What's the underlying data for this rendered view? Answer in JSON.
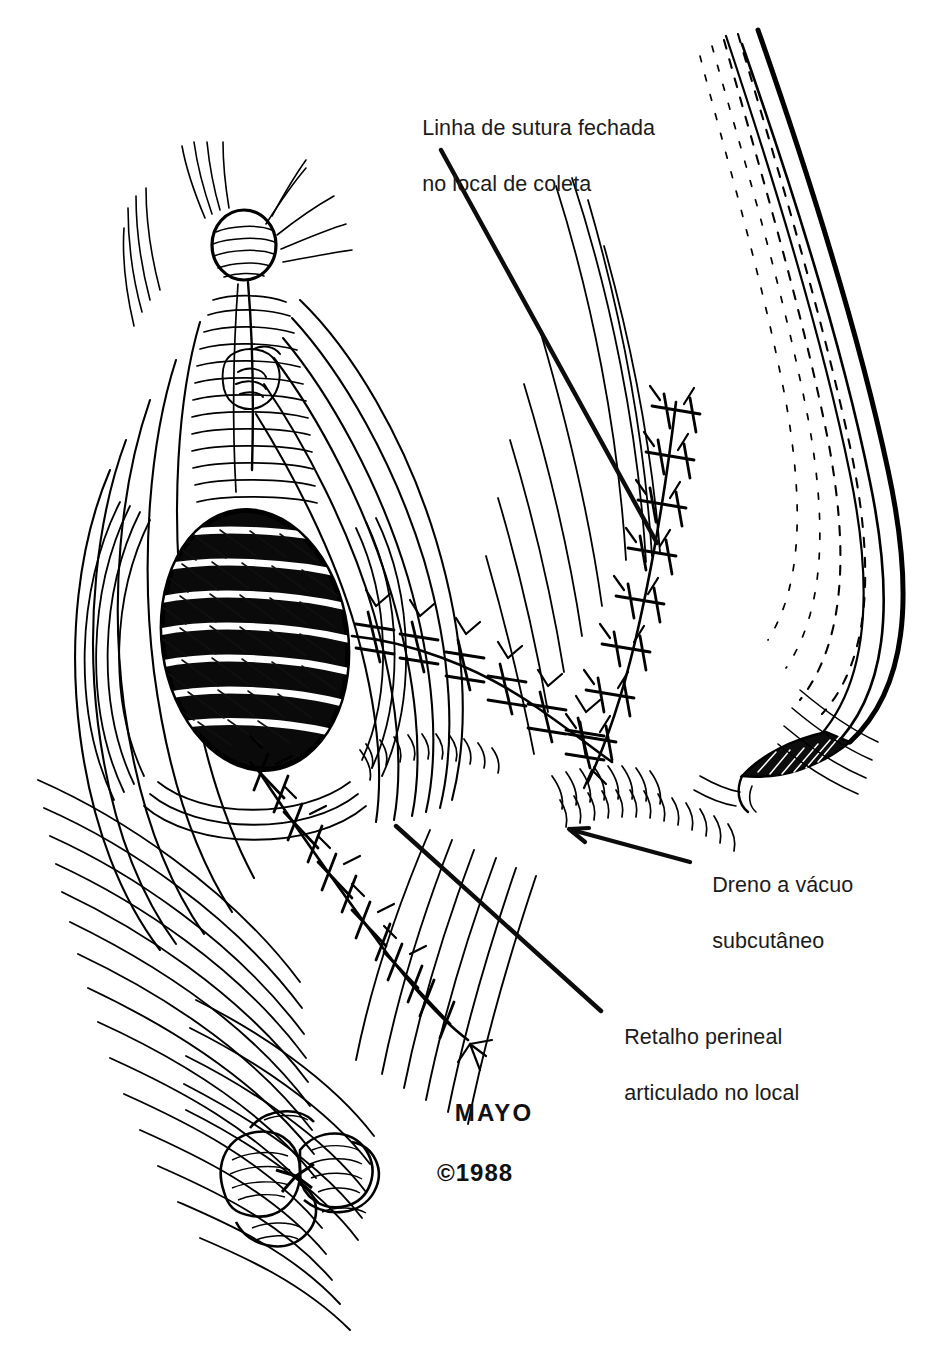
{
  "figure": {
    "kind": "medical-line-illustration",
    "technique": "pen-and-ink hatching",
    "background_color": "#ffffff",
    "ink_color": "#000000",
    "text_color": "#1b1b1b"
  },
  "labels": [
    {
      "id": "harvest-site",
      "line1": "Linha de sutura fechada",
      "line2": "no local de coleta",
      "x": 410,
      "y": 86
    },
    {
      "id": "suction-drain",
      "line1": "Dreno a vácuo",
      "line2": "subcutâneo",
      "x": 700,
      "y": 843
    },
    {
      "id": "perineal-flap",
      "line1": "Retalho perineal",
      "line2": "articulado no local",
      "x": 612,
      "y": 995
    }
  ],
  "credit": {
    "institution": "MAYO",
    "copyright": "©1988",
    "x": 437,
    "y": 1068
  },
  "leaders": [
    {
      "id": "harvest-site-leader",
      "from": [
        441,
        150
      ],
      "to": [
        657,
        543
      ],
      "arrow": false
    },
    {
      "id": "suction-drain-leader",
      "from": [
        690,
        862
      ],
      "to": [
        569,
        829
      ],
      "arrow": true
    },
    {
      "id": "perineal-flap-leader",
      "from": [
        396,
        826
      ],
      "to": [
        601,
        1011
      ],
      "arrow": false
    }
  ],
  "anatomy_parts": [
    {
      "id": "clitoral-nodule",
      "label": "rounded nodule at apex"
    },
    {
      "id": "labial-folds",
      "label": "converging hatched labial folds"
    },
    {
      "id": "vaginal-introitus",
      "label": "dark banded oval opening"
    },
    {
      "id": "perineal-flap",
      "label": "rotated flap in place"
    },
    {
      "id": "anal-verge",
      "label": "radiating anal folds"
    },
    {
      "id": "thigh-contour",
      "label": "right thigh contour"
    },
    {
      "id": "drain-tube",
      "label": "thick curved drain tube"
    }
  ],
  "suture_lines": [
    {
      "id": "vertical-suture-line",
      "description": "interrupted sutures at donor site",
      "stitches": 9
    },
    {
      "id": "flap-suture-line",
      "description": "interrupted sutures along flap margin",
      "stitches": 7
    },
    {
      "id": "lower-suture-line",
      "description": "interrupted sutures down to perineum",
      "stitches": 8
    }
  ]
}
